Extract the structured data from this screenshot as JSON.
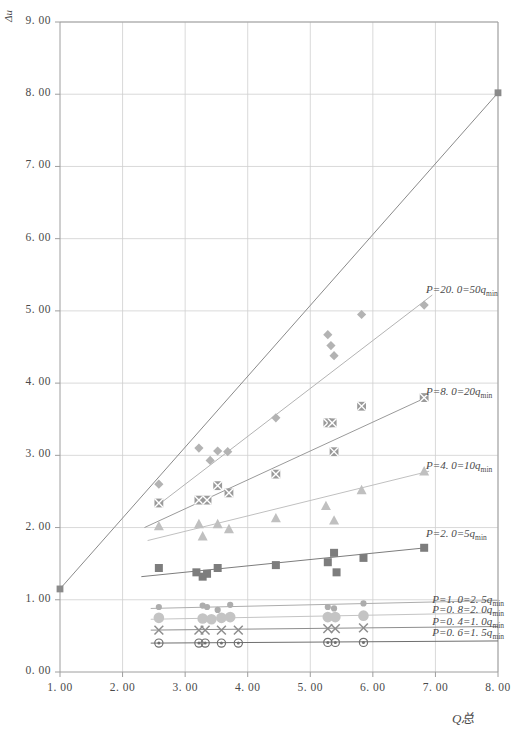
{
  "chart_data": {
    "type": "scatter",
    "title": "",
    "xlabel": "Q总",
    "ylabel": "Δu",
    "xlim": [
      1.0,
      8.0
    ],
    "ylim": [
      0.0,
      9.0
    ],
    "xticks": [
      "1. 00",
      "2. 00",
      "3. 00",
      "4. 00",
      "5. 00",
      "6. 00",
      "7. 00",
      "8. 00"
    ],
    "xtick_values": [
      1,
      2,
      3,
      4,
      5,
      6,
      7,
      8
    ],
    "yticks": [
      "0. 00",
      "1. 00",
      "2. 00",
      "3. 00",
      "4. 00",
      "5. 00",
      "6. 00",
      "7. 00",
      "8. 00",
      "9. 00"
    ],
    "ytick_values": [
      0,
      1,
      2,
      3,
      4,
      5,
      6,
      7,
      8,
      9
    ],
    "grid": true,
    "legend_position": "right-inline-annotations",
    "reference_line": {
      "name": "unity-reference-line",
      "x": [
        1.0,
        8.0
      ],
      "y": [
        1.15,
        8.02
      ],
      "color": "#8a8a8a",
      "endpoint_marker": "square"
    },
    "series": [
      {
        "name": "P=20.0=50qmin",
        "label": "P=20. 0=50q",
        "label_sub": "min",
        "label_x": 6.85,
        "label_y": 5.28,
        "marker": "diamond",
        "color": "#b3b3b3",
        "trend": {
          "x": [
            2.55,
            6.95
          ],
          "y": [
            2.3,
            5.22
          ]
        },
        "points": [
          {
            "x": 2.58,
            "y": 2.6
          },
          {
            "x": 3.22,
            "y": 3.1
          },
          {
            "x": 3.4,
            "y": 2.93
          },
          {
            "x": 3.52,
            "y": 3.06
          },
          {
            "x": 3.68,
            "y": 3.05
          },
          {
            "x": 4.45,
            "y": 3.52
          },
          {
            "x": 5.28,
            "y": 4.67
          },
          {
            "x": 5.33,
            "y": 4.52
          },
          {
            "x": 5.38,
            "y": 4.38
          },
          {
            "x": 5.82,
            "y": 4.95
          },
          {
            "x": 6.82,
            "y": 5.08
          }
        ]
      },
      {
        "name": "P=8.0=20qmin",
        "label": "P=8. 0=20q",
        "label_sub": "min",
        "label_x": 6.85,
        "label_y": 3.86,
        "marker": "crossed-square",
        "color": "#9a9a9a",
        "trend": {
          "x": [
            2.35,
            6.85
          ],
          "y": [
            2.0,
            3.8
          ]
        },
        "points": [
          {
            "x": 2.58,
            "y": 2.34
          },
          {
            "x": 3.22,
            "y": 2.38
          },
          {
            "x": 3.35,
            "y": 2.38
          },
          {
            "x": 3.52,
            "y": 2.58
          },
          {
            "x": 3.7,
            "y": 2.48
          },
          {
            "x": 4.45,
            "y": 2.74
          },
          {
            "x": 5.28,
            "y": 3.45
          },
          {
            "x": 5.35,
            "y": 3.45
          },
          {
            "x": 5.38,
            "y": 3.05
          },
          {
            "x": 5.82,
            "y": 3.68
          },
          {
            "x": 6.82,
            "y": 3.8
          }
        ]
      },
      {
        "name": "P=4.0=10qmin",
        "label": "P=4. 0=10q",
        "label_sub": "min",
        "label_x": 6.85,
        "label_y": 2.84,
        "marker": "triangle",
        "color": "#c0c0c0",
        "trend": {
          "x": [
            2.4,
            6.9
          ],
          "y": [
            1.82,
            2.78
          ]
        },
        "points": [
          {
            "x": 2.58,
            "y": 2.02
          },
          {
            "x": 3.22,
            "y": 2.05
          },
          {
            "x": 3.28,
            "y": 1.88
          },
          {
            "x": 3.52,
            "y": 2.05
          },
          {
            "x": 3.7,
            "y": 1.98
          },
          {
            "x": 4.45,
            "y": 2.13
          },
          {
            "x": 5.25,
            "y": 2.3
          },
          {
            "x": 5.38,
            "y": 2.1
          },
          {
            "x": 5.82,
            "y": 2.52
          },
          {
            "x": 6.82,
            "y": 2.78
          }
        ]
      },
      {
        "name": "P=2.0=5qmin",
        "label": "P=2. 0=5q",
        "label_sub": "min",
        "label_x": 6.85,
        "label_y": 1.9,
        "marker": "square",
        "color": "#7d7d7d",
        "trend": {
          "x": [
            2.3,
            6.85
          ],
          "y": [
            1.32,
            1.72
          ]
        },
        "points": [
          {
            "x": 2.58,
            "y": 1.44
          },
          {
            "x": 3.18,
            "y": 1.38
          },
          {
            "x": 3.28,
            "y": 1.32
          },
          {
            "x": 3.35,
            "y": 1.36
          },
          {
            "x": 3.52,
            "y": 1.44
          },
          {
            "x": 4.45,
            "y": 1.48
          },
          {
            "x": 5.28,
            "y": 1.52
          },
          {
            "x": 5.38,
            "y": 1.65
          },
          {
            "x": 5.42,
            "y": 1.38
          },
          {
            "x": 5.85,
            "y": 1.58
          },
          {
            "x": 6.82,
            "y": 1.72
          }
        ]
      },
      {
        "name": "P=1.0=2.5qmin",
        "label": "P=1. 0=2. 5q",
        "label_sub": "min",
        "label_x": 6.95,
        "label_y": 0.99,
        "marker": "small-circle",
        "color": "#adadad",
        "trend": {
          "x": [
            2.45,
            8.0
          ],
          "y": [
            0.88,
            0.99
          ]
        },
        "points": [
          {
            "x": 2.58,
            "y": 0.9
          },
          {
            "x": 3.28,
            "y": 0.92
          },
          {
            "x": 3.35,
            "y": 0.9
          },
          {
            "x": 3.52,
            "y": 0.86
          },
          {
            "x": 3.72,
            "y": 0.93
          },
          {
            "x": 5.28,
            "y": 0.9
          },
          {
            "x": 5.38,
            "y": 0.88
          },
          {
            "x": 5.85,
            "y": 0.95
          }
        ]
      },
      {
        "name": "P=0.8=2.0qmin",
        "label": "P=0. 8=2. 0q",
        "label_sub": "min",
        "label_x": 6.95,
        "label_y": 0.84,
        "marker": "big-circle",
        "color": "#c4c4c4",
        "trend": {
          "x": [
            2.45,
            8.0
          ],
          "y": [
            0.73,
            0.82
          ]
        },
        "points": [
          {
            "x": 2.58,
            "y": 0.75
          },
          {
            "x": 3.28,
            "y": 0.74
          },
          {
            "x": 3.42,
            "y": 0.73
          },
          {
            "x": 3.58,
            "y": 0.75
          },
          {
            "x": 3.72,
            "y": 0.76
          },
          {
            "x": 5.28,
            "y": 0.76
          },
          {
            "x": 5.4,
            "y": 0.76
          },
          {
            "x": 5.85,
            "y": 0.78
          }
        ]
      },
      {
        "name": "P=0.4=1.0qmin",
        "label": "P=0. 4=1. 0q",
        "label_sub": "min",
        "label_x": 6.95,
        "label_y": 0.68,
        "marker": "x-mark",
        "color": "#8e8e8e",
        "trend": {
          "x": [
            2.45,
            8.0
          ],
          "y": [
            0.58,
            0.63
          ]
        },
        "points": [
          {
            "x": 2.58,
            "y": 0.58
          },
          {
            "x": 3.22,
            "y": 0.58
          },
          {
            "x": 3.32,
            "y": 0.58
          },
          {
            "x": 3.58,
            "y": 0.58
          },
          {
            "x": 3.85,
            "y": 0.58
          },
          {
            "x": 5.28,
            "y": 0.6
          },
          {
            "x": 5.4,
            "y": 0.6
          },
          {
            "x": 5.85,
            "y": 0.61
          }
        ]
      },
      {
        "name": "P=0.6=1.5qmin",
        "label": "P=0. 6=1. 5q",
        "label_sub": "min",
        "label_x": 6.95,
        "label_y": 0.52,
        "marker": "circled-dot",
        "color": "#6f6f6f",
        "trend": {
          "x": [
            2.45,
            8.0
          ],
          "y": [
            0.4,
            0.43
          ]
        },
        "points": [
          {
            "x": 2.58,
            "y": 0.4
          },
          {
            "x": 3.22,
            "y": 0.4
          },
          {
            "x": 3.32,
            "y": 0.4
          },
          {
            "x": 3.58,
            "y": 0.4
          },
          {
            "x": 3.85,
            "y": 0.4
          },
          {
            "x": 5.28,
            "y": 0.41
          },
          {
            "x": 5.4,
            "y": 0.41
          },
          {
            "x": 5.85,
            "y": 0.41
          }
        ]
      }
    ]
  },
  "plot": {
    "background": "#ffffff",
    "grid_color": "#cfcfcf",
    "frame_color": "#9e9e9e",
    "tick_text_color": "#4a4a4a"
  }
}
